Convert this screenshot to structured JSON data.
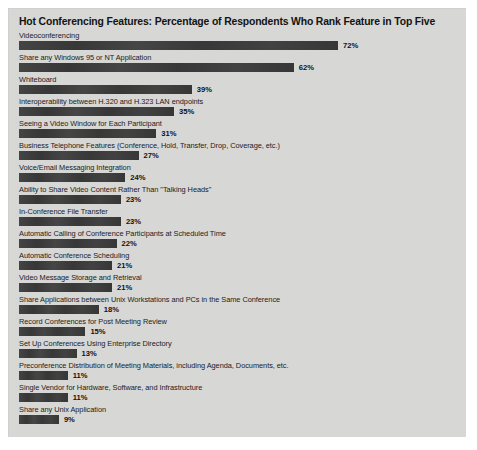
{
  "chart_data": {
    "type": "bar",
    "orientation": "horizontal",
    "title": "Hot Conferencing Features: Percentage of Respondents Who Rank Feature in Top Five",
    "xlabel": "",
    "ylabel": "",
    "xlim": [
      0,
      80
    ],
    "grid": false,
    "legend": "none",
    "value_suffix": "%",
    "bar_color": "#3a3a3a",
    "panel_color": "#d7d7d5",
    "categories": [
      "Videoconferencing",
      "Share any Windows 95 or NT Application",
      "Whiteboard",
      "Interoperability between H.320 and H.323 LAN endpoints",
      "Seeing a Video Window for Each Participant",
      "Business Telephone Features (Conference, Hold, Transfer, Drop, Coverage, etc.)",
      "Voice/Email Messaging Integration",
      "Ability to Share Video Content Rather Than \"Talking Heads\"",
      "In-Conference File Transfer",
      "Automatic Calling of Conference Participants at Scheduled Time",
      "Automatic Conference Scheduling",
      "Video Message Storage and Retrieval",
      "Share Applications between Unix Workstations and PCs in the Same Conference",
      "Record Conferences for Post Meeting Review",
      "Set Up Conferences Using Enterprise Directory",
      "Preconference Distribution of Meeting Materials, including Agenda, Documents, etc.",
      "Single Vendor for Hardware, Software, and Infrastructure",
      "Share any Unix Application"
    ],
    "values": [
      72,
      62,
      39,
      35,
      31,
      27,
      24,
      23,
      23,
      22,
      21,
      21,
      18,
      15,
      13,
      11,
      11,
      9
    ],
    "value_labels": [
      "72%",
      "62%",
      "39%",
      "35%",
      "31%",
      "27%",
      "24%",
      "23%",
      "23%",
      "22%",
      "21%",
      "21%",
      "18%",
      "15%",
      "13%",
      "11%",
      "11%",
      "9%"
    ]
  }
}
